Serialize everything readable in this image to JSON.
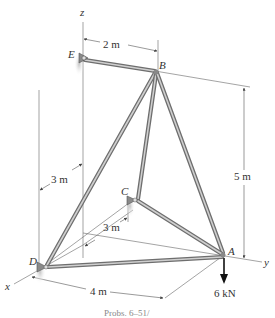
{
  "figure": {
    "type": "space truss",
    "axes": {
      "x": "x",
      "y": "y",
      "z": "z"
    },
    "joints": [
      {
        "id": "E",
        "label": "E",
        "support": "ball-and-socket"
      },
      {
        "id": "B",
        "label": "B"
      },
      {
        "id": "C",
        "label": "C",
        "support": "ball-and-socket"
      },
      {
        "id": "D",
        "label": "D",
        "support": "ball-and-socket"
      },
      {
        "id": "A",
        "label": "A"
      }
    ],
    "members": [
      "EB",
      "BD",
      "BC",
      "BA",
      "CA",
      "DA"
    ],
    "dimensions": {
      "eb_horizontal": "2 m",
      "height": "5 m",
      "d_offset": "3 m",
      "c_offset": "3 m",
      "da_length": "4 m"
    },
    "load": {
      "label": "6 kN",
      "at": "A",
      "direction": "down"
    },
    "caption": "Probs. 6–51/"
  }
}
